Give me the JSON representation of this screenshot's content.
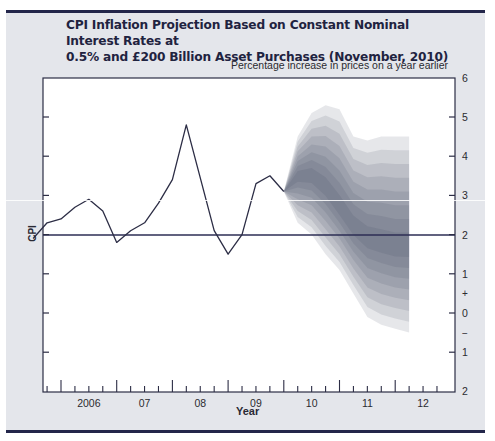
{
  "chart_data": {
    "type": "line",
    "title": "CPI Inflation Projection Based on Constant Nominal Interest Rates at 0.5%  and £200 Billion Asset Purchases (November, 2010)",
    "title_lines": [
      "CPI Inflation Projection Based on Constant Nominal Interest Rates at",
      "0.5%  and £200 Billion Asset Purchases (November, 2010)"
    ],
    "subtitle": "Percentage increase in prices on a year earlier",
    "xlabel": "Year",
    "ylabel": "CPI",
    "x_ticks": [
      "2006",
      "07",
      "08",
      "09",
      "10",
      "11",
      "12"
    ],
    "y_tick_labels": [
      "6",
      "5",
      "4",
      "3",
      "2",
      "1",
      "+",
      "0",
      "−",
      "1",
      "2"
    ],
    "ylim": [
      -2,
      6
    ],
    "target_line": 2,
    "grid": false,
    "legend": null,
    "series": [
      {
        "name": "CPI inflation (outturn)",
        "x": [
          2005.5,
          2005.75,
          2006.0,
          2006.25,
          2006.5,
          2006.75,
          2007.0,
          2007.25,
          2007.5,
          2007.75,
          2008.0,
          2008.25,
          2008.75,
          2009.0,
          2009.25,
          2009.5,
          2009.75,
          2010.0
        ],
        "values": [
          1.9,
          2.3,
          2.4,
          2.7,
          2.9,
          2.6,
          1.8,
          2.1,
          2.3,
          2.8,
          3.4,
          4.8,
          2.1,
          1.5,
          2.0,
          3.3,
          3.5,
          3.1
        ]
      },
      {
        "name": "Projection fan (central path approx.)",
        "x": [
          2010.0,
          2010.25,
          2010.5,
          2010.75,
          2011.0,
          2011.25,
          2011.5,
          2011.75,
          2012.0,
          2012.25
        ],
        "values": [
          3.1,
          3.5,
          3.5,
          3.2,
          2.7,
          2.2,
          1.9,
          1.8,
          1.7,
          1.7
        ],
        "upper_outer": [
          3.1,
          4.5,
          5.1,
          5.3,
          5.2,
          4.5,
          4.4,
          4.5,
          4.5,
          4.5
        ],
        "lower_outer": [
          3.1,
          2.3,
          2.0,
          1.5,
          1.1,
          0.5,
          -0.1,
          -0.3,
          -0.4,
          -0.5
        ]
      }
    ]
  },
  "colors": {
    "panel_bg": "#e4e6eb",
    "rule": "#23264a",
    "title": "#1f2340",
    "line": "#2c2d45",
    "fan": "#3e4560"
  }
}
